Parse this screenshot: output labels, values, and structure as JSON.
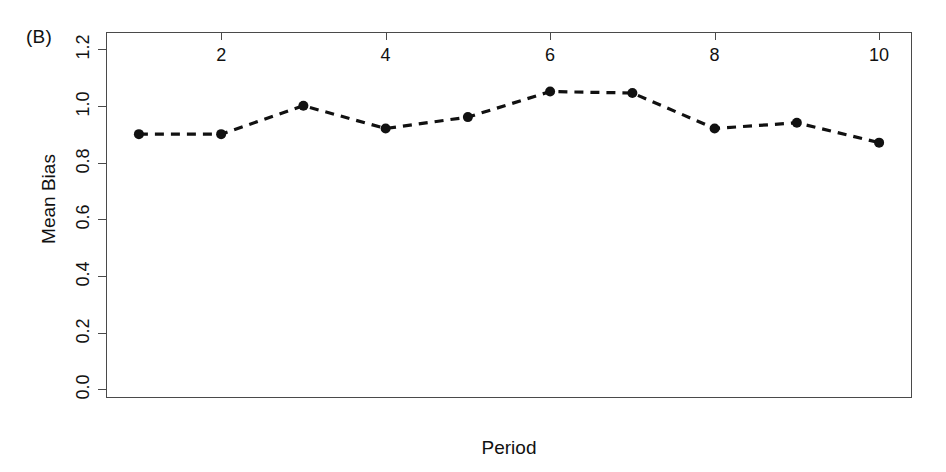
{
  "figure": {
    "panel_label": "(B)",
    "background_color": "#ffffff",
    "axis_color": "#4a4a4a",
    "series_color": "#111111"
  },
  "chart_data": {
    "type": "line",
    "title": "",
    "subtitle": "",
    "panel": "(B)",
    "xlabel": "Period",
    "ylabel": "Mean Bias",
    "x": [
      1,
      2,
      3,
      4,
      5,
      6,
      7,
      8,
      9,
      10
    ],
    "values": [
      0.9,
      0.9,
      1.0,
      0.92,
      0.96,
      1.05,
      1.045,
      0.92,
      0.94,
      0.87
    ],
    "series": [
      {
        "name": "Mean Bias",
        "values": [
          0.9,
          0.9,
          1.0,
          0.92,
          0.96,
          1.05,
          1.045,
          0.92,
          0.94,
          0.87
        ],
        "line_style": "dashed",
        "marker": "filled-circle",
        "color": "#111111"
      }
    ],
    "xlim": [
      0.6,
      10.4
    ],
    "ylim": [
      -0.03,
      1.26
    ],
    "xticks": [
      2,
      4,
      6,
      8,
      10
    ],
    "xtick_labels": [
      "2",
      "4",
      "6",
      "8",
      "10"
    ],
    "yticks": [
      0.0,
      0.2,
      0.4,
      0.6,
      0.8,
      1.0,
      1.2
    ],
    "ytick_labels": [
      "0.0",
      "0.2",
      "0.4",
      "0.6",
      "0.8",
      "1.0",
      "1.2"
    ],
    "grid": false,
    "legend": null,
    "legend_position": "none",
    "annotations": []
  }
}
